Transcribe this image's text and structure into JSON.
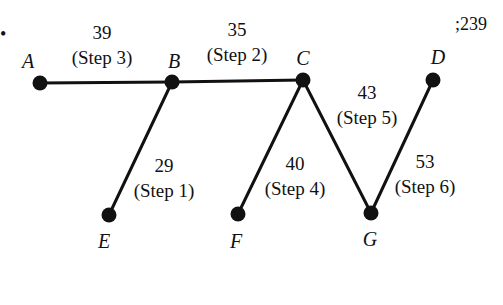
{
  "corner_text": ";239",
  "bullet": "•",
  "nodes": {
    "A": {
      "label": "A",
      "x": 40,
      "y": 83,
      "lx": 28,
      "ly": 68
    },
    "B": {
      "label": "B",
      "x": 172,
      "y": 82,
      "lx": 174,
      "ly": 68
    },
    "C": {
      "label": "C",
      "x": 303,
      "y": 80,
      "lx": 303,
      "ly": 65
    },
    "D": {
      "label": "D",
      "x": 433,
      "y": 80,
      "lx": 438,
      "ly": 64
    },
    "E": {
      "label": "E",
      "x": 109,
      "y": 215,
      "lx": 104,
      "ly": 248
    },
    "F": {
      "label": "F",
      "x": 238,
      "y": 214,
      "lx": 236,
      "ly": 248
    },
    "G": {
      "label": "G",
      "x": 371,
      "y": 213,
      "lx": 370,
      "ly": 246
    }
  },
  "edges": [
    {
      "from": "B",
      "to": "E",
      "weight": "29",
      "step": "(Step 1)",
      "wx": 164,
      "wy": 172,
      "sx": 164,
      "sy": 197
    },
    {
      "from": "B",
      "to": "C",
      "weight": "35",
      "step": "(Step 2)",
      "wx": 237,
      "wy": 36,
      "sx": 237,
      "sy": 61
    },
    {
      "from": "A",
      "to": "B",
      "weight": "39",
      "step": "(Step 3)",
      "wx": 102,
      "wy": 39,
      "sx": 102,
      "sy": 64
    },
    {
      "from": "C",
      "to": "F",
      "weight": "40",
      "step": "(Step 4)",
      "wx": 295,
      "wy": 170,
      "sx": 295,
      "sy": 195
    },
    {
      "from": "C",
      "to": "G",
      "weight": "43",
      "step": "(Step 5)",
      "wx": 367,
      "wy": 99,
      "sx": 367,
      "sy": 124
    },
    {
      "from": "G",
      "to": "D",
      "weight": "53",
      "step": "(Step 6)",
      "wx": 425,
      "wy": 168,
      "sx": 425,
      "sy": 193
    }
  ]
}
